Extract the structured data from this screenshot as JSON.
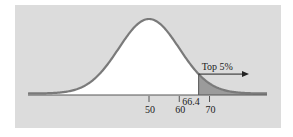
{
  "chart_data": {
    "type": "area",
    "title": "",
    "xlabel": "",
    "ylabel": "",
    "distribution": "normal",
    "mean": 50,
    "sd": 10,
    "xlim": [
      10,
      89
    ],
    "tick_values": [
      50,
      60,
      66.4,
      70
    ],
    "tick_labels": [
      "50",
      "60",
      "66.4",
      "70"
    ],
    "shaded_region": {
      "from": 66.4,
      "to": 89,
      "label": "Top 5%",
      "proportion": 0.05
    },
    "annotation": {
      "text": "Top 5%",
      "arrow": "right"
    },
    "grid": false,
    "legend": null
  },
  "colors": {
    "panel_bg": "#dcdcdc",
    "curve": "#7a7a7a",
    "area_fill": "#ffffff",
    "shaded_fill": "#9b9b9b",
    "axis": "#555555",
    "text": "#222222"
  }
}
